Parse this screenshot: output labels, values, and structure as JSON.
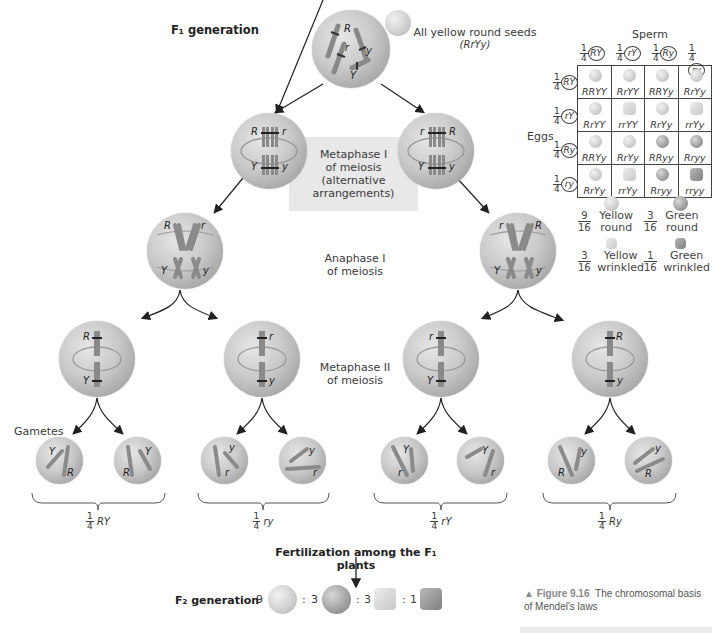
{
  "figure": {
    "title_f1": "F₁ generation",
    "f1_seed_label": "All yellow round seeds",
    "f1_genotype": "(RrYy)",
    "metaphase1_label": [
      "Metaphase I",
      "of meiosis",
      "(alternative",
      "arrangements)"
    ],
    "anaphase1_label": [
      "Anaphase I",
      "of meiosis"
    ],
    "metaphase2_label": [
      "Metaphase II",
      "of meiosis"
    ],
    "gametes_label": "Gametes",
    "fertilization_label": "Fertilization among the F₁ plants",
    "f2_label": "F₂ generation",
    "f2_ratio": [
      {
        "count": "9",
        "phenotype": "yellow round"
      },
      {
        "count": "3",
        "phenotype": "green round"
      },
      {
        "count": "3",
        "phenotype": "yellow wrinkled"
      },
      {
        "count": "1",
        "phenotype": "green wrinkled"
      }
    ],
    "f2_ratio_sep": ":",
    "caption_fig": "▲ Figure 9.16",
    "caption_text": "The chromosomal basis of Mendel's laws"
  },
  "cells": {
    "f1": {
      "alleles": [
        "R",
        "r",
        "y",
        "Y"
      ]
    },
    "meta1_left": {
      "alleles": [
        "R",
        "r",
        "Y",
        "y"
      ]
    },
    "meta1_right": {
      "alleles": [
        "r",
        "R",
        "Y",
        "y"
      ]
    },
    "ana1_left": {
      "alleles": [
        "R",
        "r",
        "Y",
        "y"
      ]
    },
    "ana1_right": {
      "alleles": [
        "r",
        "R",
        "Y",
        "y"
      ]
    },
    "meta2": [
      {
        "top": "R",
        "bottom": "Y"
      },
      {
        "top": "r",
        "bottom": "y"
      },
      {
        "top": "r",
        "bottom": "Y"
      },
      {
        "top": "R",
        "bottom": "y"
      }
    ],
    "gametes": [
      {
        "a": "Y",
        "b": "R"
      },
      {
        "a": "Y",
        "b": "R"
      },
      {
        "a": "y",
        "b": "r"
      },
      {
        "a": "y",
        "b": "r"
      },
      {
        "a": "Y",
        "b": "r"
      },
      {
        "a": "Y",
        "b": "r"
      },
      {
        "a": "y",
        "b": "R"
      },
      {
        "a": "y",
        "b": "R"
      }
    ]
  },
  "gamete_groups": [
    {
      "fraction_num": "1",
      "fraction_den": "4",
      "genotype": "RY"
    },
    {
      "fraction_num": "1",
      "fraction_den": "4",
      "genotype": "ry"
    },
    {
      "fraction_num": "1",
      "fraction_den": "4",
      "genotype": "rY"
    },
    {
      "fraction_num": "1",
      "fraction_den": "4",
      "genotype": "Ry"
    }
  ],
  "punnett": {
    "sperm_label": "Sperm",
    "eggs_label": "Eggs",
    "fraction_num": "1",
    "fraction_den": "4",
    "sperm": [
      "RY",
      "rY",
      "Ry",
      "ry"
    ],
    "eggs": [
      "RY",
      "rY",
      "Ry",
      "ry"
    ],
    "rows": [
      [
        {
          "g": "RRYY",
          "p": "yr"
        },
        {
          "g": "RrYY",
          "p": "yr"
        },
        {
          "g": "RRYy",
          "p": "yr"
        },
        {
          "g": "RrYy",
          "p": "yr"
        }
      ],
      [
        {
          "g": "RrYY",
          "p": "yr"
        },
        {
          "g": "rrYY",
          "p": "yw"
        },
        {
          "g": "RrYy",
          "p": "yr"
        },
        {
          "g": "rrYy",
          "p": "yw"
        }
      ],
      [
        {
          "g": "RRYy",
          "p": "yr"
        },
        {
          "g": "RrYy",
          "p": "yr"
        },
        {
          "g": "RRyy",
          "p": "gr"
        },
        {
          "g": "Rryy",
          "p": "gr"
        }
      ],
      [
        {
          "g": "RrYy",
          "p": "yr"
        },
        {
          "g": "rrYy",
          "p": "yw"
        },
        {
          "g": "Rryy",
          "p": "gr"
        },
        {
          "g": "rryy",
          "p": "gw"
        }
      ]
    ],
    "phenotypes": [
      {
        "num": "9",
        "den": "16",
        "label1": "Yellow",
        "label2": "round",
        "type": "yr"
      },
      {
        "num": "3",
        "den": "16",
        "label1": "Green",
        "label2": "round",
        "type": "gr"
      },
      {
        "num": "3",
        "den": "16",
        "label1": "Yellow",
        "label2": "wrinkled",
        "type": "yw"
      },
      {
        "num": "1",
        "den": "16",
        "label1": "Green",
        "label2": "wrinkled",
        "type": "gw"
      }
    ]
  },
  "colors": {
    "cell_fill": "#c8c8c8",
    "chromosome": "#8c8c8c",
    "box_fill": "#e8e8e8",
    "text": "#333333"
  }
}
